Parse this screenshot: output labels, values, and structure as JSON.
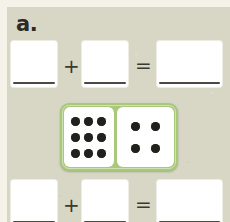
{
  "worksheet": {
    "problem_label": "a.",
    "background_color": "#d8d7c6",
    "page_color": "#f4f2e9"
  },
  "equations": [
    {
      "position": "top",
      "boxes": [
        {
          "name": "addend-1",
          "value": "",
          "placeholder": ""
        },
        {
          "name": "addend-2",
          "value": "",
          "placeholder": ""
        },
        {
          "name": "sum",
          "value": "",
          "placeholder": ""
        }
      ],
      "operators": {
        "plus": "+",
        "equals": "="
      }
    },
    {
      "position": "bottom",
      "boxes": [
        {
          "name": "addend-1",
          "value": "",
          "placeholder": ""
        },
        {
          "name": "addend-2",
          "value": "",
          "placeholder": ""
        },
        {
          "name": "sum",
          "value": "",
          "placeholder": ""
        }
      ],
      "operators": {
        "plus": "+",
        "equals": "="
      }
    }
  ],
  "domino": {
    "border_color": "#a8c87a",
    "face_color": "#ffffff",
    "pip_color": "#20201c",
    "left_half": {
      "pip_count": 9,
      "arrangement": "3x3-grid"
    },
    "right_half": {
      "pip_count": 4,
      "arrangement": "four-corners"
    }
  }
}
